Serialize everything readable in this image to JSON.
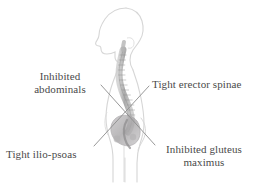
{
  "figure": {
    "colors": {
      "outline": "#d2d2d2",
      "spine": "#a9a9a9",
      "pelvis": "#b0aeb0",
      "leader_line": "#8c8c8c",
      "text": "#4a4a4a",
      "background": "#ffffff"
    }
  },
  "labels": [
    {
      "id": "abdominals",
      "text": "Inhibited\nabdominals",
      "align": "center",
      "leader": {
        "x1": 101,
        "y1": 85,
        "x2": 152,
        "y2": 142
      }
    },
    {
      "id": "erector_spinae",
      "text": "Tight erector spinae",
      "align": "left",
      "leader": {
        "x1": 148,
        "y1": 86,
        "x2": 95,
        "y2": 145
      }
    },
    {
      "id": "ilio_psoas",
      "text": "Tight ilio-psoas",
      "align": "left",
      "leader": {
        "x1": 96,
        "y1": 146,
        "x2": 148,
        "y2": 87
      }
    },
    {
      "id": "gluteus_maximus",
      "text": "Inhibited gluteus\nmaximus",
      "align": "center",
      "leader": {
        "x1": 151,
        "y1": 143,
        "x2": 101,
        "y2": 86
      }
    }
  ]
}
